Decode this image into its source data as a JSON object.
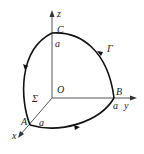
{
  "diagram": {
    "type": "3d-axes-curve",
    "axes": {
      "x": {
        "label": "x"
      },
      "y": {
        "label": "y"
      },
      "z": {
        "label": "z"
      }
    },
    "origin": {
      "label": "O"
    },
    "points": {
      "A": {
        "label": "A",
        "distance_label": "a"
      },
      "B": {
        "label": "B",
        "distance_label": "a"
      },
      "C": {
        "label": "C",
        "distance_label": "a"
      }
    },
    "curve": {
      "label": "Γ",
      "orientation": "C → B → A → C"
    },
    "surface": {
      "label": "Σ"
    },
    "colors": {
      "ink": "#222222",
      "axis": "#555555"
    }
  }
}
